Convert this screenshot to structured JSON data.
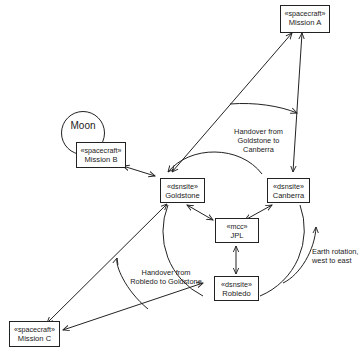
{
  "diagram": {
    "type": "deployment-diagram",
    "moon": {
      "label": "Moon"
    },
    "nodes": {
      "mission_a": {
        "stereotype": "«spacecraft»",
        "name": "Mission A"
      },
      "mission_b": {
        "stereotype": "«spacecraft»",
        "name": "Mission B"
      },
      "mission_c": {
        "stereotype": "«spacecraft»",
        "name": "Mission C"
      },
      "goldstone": {
        "stereotype": "«dsnsite»",
        "name": "Goldstone"
      },
      "canberra": {
        "stereotype": "«dsnsite»",
        "name": "Canberra"
      },
      "robledo": {
        "stereotype": "«dsnsite»",
        "name": "Robledo"
      },
      "jpl": {
        "stereotype": "«mcc»",
        "name": "JPL"
      }
    },
    "annotations": {
      "handover_gc": "Handover from Goldstone to Canberra",
      "handover_rg": "Handover from Robledo to Goldstone",
      "earth_rotation": "Earth rotation, west to east"
    },
    "edges": [
      {
        "from": "Goldstone",
        "to": "Mission A"
      },
      {
        "from": "Canberra",
        "to": "Mission A"
      },
      {
        "from": "Goldstone",
        "to": "Mission B"
      },
      {
        "from": "Goldstone",
        "to": "Mission C"
      },
      {
        "from": "Robledo",
        "to": "Mission C"
      },
      {
        "from": "JPL",
        "to": "Goldstone"
      },
      {
        "from": "JPL",
        "to": "Canberra"
      },
      {
        "from": "JPL",
        "to": "Robledo"
      }
    ]
  }
}
